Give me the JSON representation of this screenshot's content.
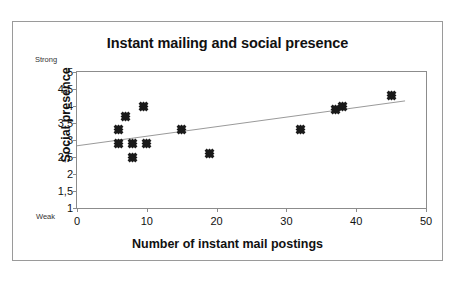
{
  "chart_data": {
    "type": "scatter",
    "title": "Instant mailing and social presence",
    "xlabel": "Number of instant mail postings",
    "ylabel": "Social presence",
    "xlim": [
      0,
      50
    ],
    "ylim": [
      1,
      5
    ],
    "grid": false,
    "legend": null,
    "xticks": [
      "0",
      "10",
      "20",
      "30",
      "40",
      "50"
    ],
    "xtick_values": [
      0,
      10,
      20,
      30,
      40,
      50
    ],
    "yticks": [
      "1",
      "1,5",
      "2",
      "2,5",
      "3",
      "3,5",
      "4",
      "4,5",
      "5"
    ],
    "ytick_values": [
      1,
      1.5,
      2,
      2.5,
      3,
      3.5,
      4,
      4.5,
      5
    ],
    "annotations": {
      "y_axis_high": "Strong",
      "y_axis_low": "Weak"
    },
    "series": [
      {
        "name": "observations",
        "marker": "diamond",
        "color": "#1a1a1a",
        "points": [
          {
            "x": 6,
            "y": 3.3
          },
          {
            "x": 6,
            "y": 2.9
          },
          {
            "x": 7,
            "y": 3.7
          },
          {
            "x": 8,
            "y": 2.9
          },
          {
            "x": 8,
            "y": 2.5
          },
          {
            "x": 9.5,
            "y": 4.0
          },
          {
            "x": 10,
            "y": 2.9
          },
          {
            "x": 15,
            "y": 3.3
          },
          {
            "x": 19,
            "y": 2.6
          },
          {
            "x": 32,
            "y": 3.3
          },
          {
            "x": 37,
            "y": 3.9
          },
          {
            "x": 38,
            "y": 4.0
          },
          {
            "x": 45,
            "y": 4.3
          }
        ]
      }
    ],
    "trendline": {
      "type": "linear",
      "color": "#9a9a9a",
      "x_start": 0,
      "y_start": 2.83,
      "x_end": 47,
      "y_end": 4.15
    }
  }
}
